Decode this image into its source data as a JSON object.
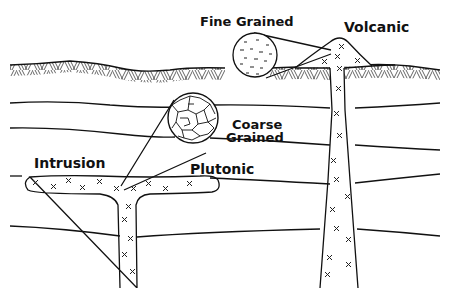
{
  "diagram": {
    "labels": {
      "fine_grained": "Fine Grained",
      "volcanic": "Volcanic",
      "coarse_line1": "Coarse",
      "coarse_line2": "Grained",
      "intrusion": "Intrusion",
      "plutonic": "Plutonic"
    },
    "colors": {
      "ink": "#111111",
      "background": "#ffffff"
    }
  }
}
